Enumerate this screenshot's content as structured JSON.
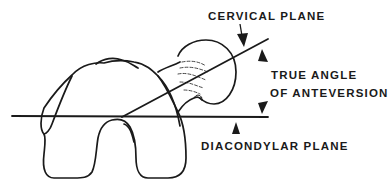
{
  "diagram": {
    "labels": {
      "cervical_plane": "CERVICAL PLANE",
      "true_angle_line1": "TRUE ANGLE",
      "true_angle_line2": "OF ANTEVERSION",
      "diacondylar_plane": "DIACONDYLAR PLANE"
    },
    "colors": {
      "ink": "#1a1a1a",
      "background": "#ffffff"
    }
  }
}
